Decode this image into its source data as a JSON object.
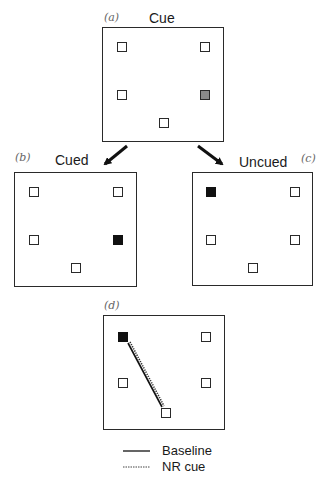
{
  "figure": {
    "panels": [
      {
        "id": "a",
        "letter": "(a)",
        "title": "Cue",
        "squares": [
          {
            "position": "top-left",
            "fill": "empty"
          },
          {
            "position": "top-right",
            "fill": "empty"
          },
          {
            "position": "middle-left",
            "fill": "empty"
          },
          {
            "position": "middle-right",
            "fill": "gray"
          },
          {
            "position": "bottom-center",
            "fill": "empty"
          }
        ]
      },
      {
        "id": "b",
        "letter": "(b)",
        "title": "Cued",
        "squares": [
          {
            "position": "top-left",
            "fill": "empty"
          },
          {
            "position": "top-right",
            "fill": "empty"
          },
          {
            "position": "middle-left",
            "fill": "empty"
          },
          {
            "position": "middle-right",
            "fill": "black"
          },
          {
            "position": "bottom-center",
            "fill": "empty"
          }
        ]
      },
      {
        "id": "c",
        "letter": "(c)",
        "title": "Uncued",
        "squares": [
          {
            "position": "top-left",
            "fill": "black"
          },
          {
            "position": "top-right",
            "fill": "empty"
          },
          {
            "position": "middle-left",
            "fill": "empty"
          },
          {
            "position": "middle-right",
            "fill": "empty"
          },
          {
            "position": "bottom-center",
            "fill": "empty"
          }
        ]
      },
      {
        "id": "d",
        "letter": "(d)",
        "title": "",
        "squares": [
          {
            "position": "top-left",
            "fill": "black"
          },
          {
            "position": "top-right",
            "fill": "empty"
          },
          {
            "position": "middle-left",
            "fill": "empty"
          },
          {
            "position": "middle-right",
            "fill": "empty"
          },
          {
            "position": "bottom-center",
            "fill": "empty"
          }
        ],
        "trajectory": {
          "from": "bottom-center",
          "to": "top-left"
        }
      }
    ],
    "arrows": [
      {
        "from": "a",
        "to": "b"
      },
      {
        "from": "a",
        "to": "c"
      }
    ],
    "legend": {
      "items": [
        {
          "style": "solid",
          "label": "Baseline"
        },
        {
          "style": "dotted",
          "label": "NR cue"
        }
      ]
    },
    "colors": {
      "stroke": "#2a2a2a",
      "target_fill": "#111111",
      "cue_fill": "#8a8a8a",
      "letter": "#666666"
    }
  }
}
